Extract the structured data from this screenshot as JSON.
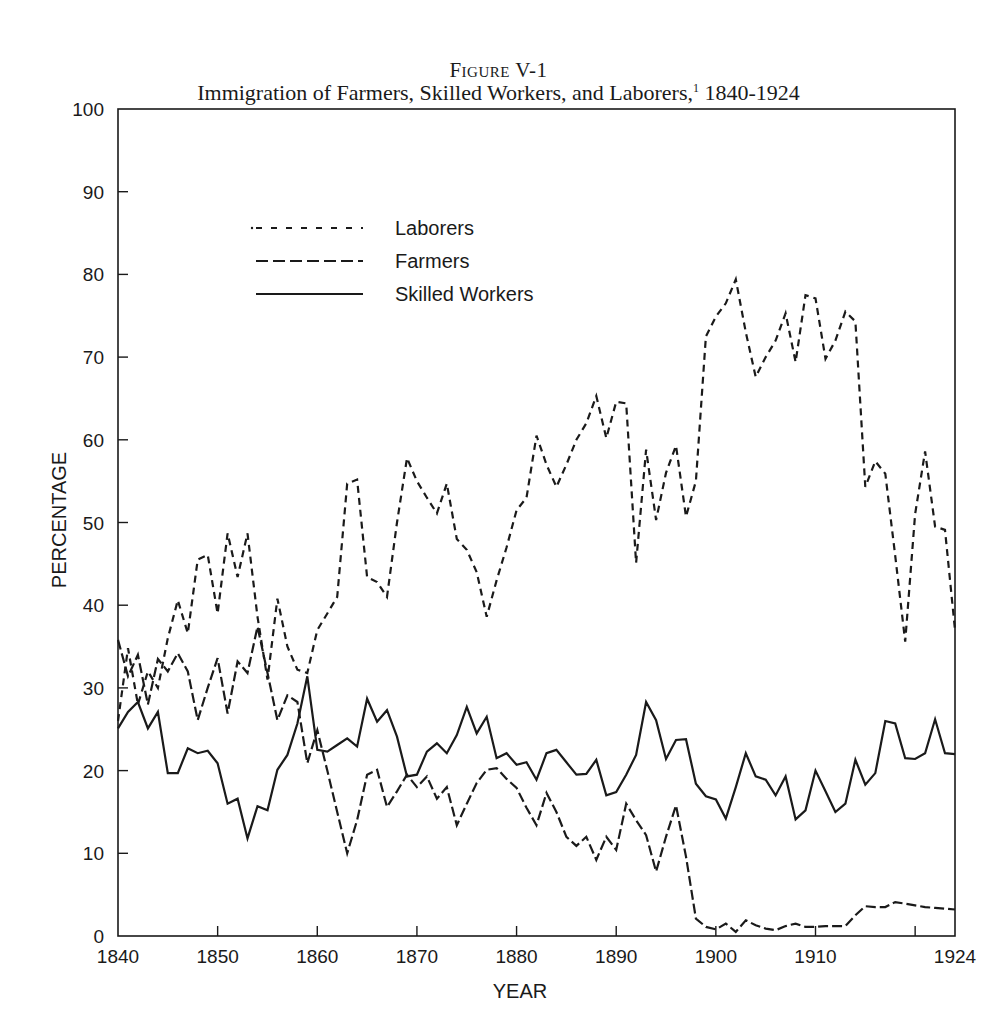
{
  "figure": {
    "number": "Figure V-1",
    "title": "Immigration of Farmers, Skilled Workers, and Laborers,",
    "footnote_mark": "1",
    "title_range": "1840-1924"
  },
  "chart_data": {
    "type": "line",
    "subtitle": "Figure V-1",
    "xlabel": "YEAR",
    "ylabel": "PERCENTAGE",
    "xlim": [
      1840,
      1924
    ],
    "ylim": [
      0,
      100
    ],
    "x_ticks": [
      1840,
      1850,
      1860,
      1870,
      1880,
      1890,
      1900,
      1910,
      1920,
      1924
    ],
    "x_tick_labels": [
      "1840",
      "1850",
      "1860",
      "1870",
      "1880",
      "1890",
      "1900",
      "1910",
      "",
      "1924"
    ],
    "y_ticks": [
      0,
      10,
      20,
      30,
      40,
      50,
      60,
      70,
      80,
      90,
      100
    ],
    "grid": false,
    "legend_position": "upper-left inside plot",
    "x": [
      1840,
      1841,
      1842,
      1843,
      1844,
      1845,
      1846,
      1847,
      1848,
      1849,
      1850,
      1851,
      1852,
      1853,
      1854,
      1855,
      1856,
      1857,
      1858,
      1859,
      1860,
      1861,
      1862,
      1863,
      1864,
      1865,
      1866,
      1867,
      1868,
      1869,
      1870,
      1871,
      1872,
      1873,
      1874,
      1875,
      1876,
      1877,
      1878,
      1879,
      1880,
      1881,
      1882,
      1883,
      1884,
      1885,
      1886,
      1887,
      1888,
      1889,
      1890,
      1891,
      1892,
      1893,
      1894,
      1895,
      1896,
      1897,
      1898,
      1899,
      1900,
      1901,
      1902,
      1903,
      1904,
      1905,
      1906,
      1907,
      1908,
      1909,
      1910,
      1911,
      1912,
      1913,
      1914,
      1915,
      1916,
      1917,
      1918,
      1919,
      1920,
      1921,
      1922,
      1923,
      1924
    ],
    "series": [
      {
        "name": "Laborers",
        "style": "short-dash",
        "values": [
          26,
          34.8,
          28,
          32,
          30,
          36,
          40.6,
          36.6,
          45.5,
          46.1,
          39,
          48.7,
          43.4,
          48.7,
          38.6,
          31,
          40.8,
          35,
          32.2,
          31.8,
          37,
          39,
          41,
          54.7,
          55.2,
          43.4,
          42.8,
          41,
          50,
          57.8,
          55,
          53,
          51.1,
          54.7,
          48,
          46.7,
          44,
          38.6,
          43,
          47,
          51.5,
          53,
          60.5,
          57,
          54.3,
          57,
          60,
          62,
          65.3,
          60.2,
          64.6,
          64.4,
          45.1,
          58.8,
          50.3,
          56,
          59.3,
          50.7,
          55,
          72.5,
          74.9,
          76.5,
          79.4,
          73,
          67.6,
          70,
          72,
          75.3,
          69.4,
          77.5,
          77.1,
          69.8,
          72,
          75.5,
          74.3,
          54.3,
          57.4,
          55.9,
          46,
          35.6,
          51,
          58.6,
          49.5,
          49.1,
          37
        ]
      },
      {
        "name": "Farmers",
        "style": "long-dash",
        "values": [
          35.8,
          31.4,
          34,
          28,
          33.5,
          32,
          34.2,
          32,
          26.1,
          30,
          33.6,
          26.9,
          33.2,
          31.8,
          37.4,
          31.8,
          26.1,
          29.1,
          28.3,
          20.9,
          24.9,
          20,
          15,
          10,
          14,
          19.5,
          20.1,
          15.6,
          17.5,
          19.5,
          18,
          19.3,
          16.6,
          18,
          13.4,
          16,
          18.5,
          20.1,
          20.3,
          19,
          17.9,
          15.5,
          13.4,
          17.3,
          15,
          12,
          10.9,
          12,
          9.2,
          12,
          10.4,
          16,
          14,
          12.2,
          7.8,
          12,
          15.8,
          9.6,
          2.1,
          1.1,
          0.8,
          1.5,
          0.5,
          1.9,
          1.3,
          0.9,
          0.7,
          1.2,
          1.5,
          1.1,
          1.1,
          1.2,
          1.2,
          1.2,
          2.5,
          3.6,
          3.5,
          3.5,
          4.1,
          3.9,
          3.7,
          3.5,
          3.4,
          3.3,
          3.2
        ]
      },
      {
        "name": "Skilled Workers",
        "style": "solid",
        "values": [
          25.1,
          27.1,
          28.3,
          25.1,
          27.1,
          19.7,
          19.7,
          22.7,
          22.1,
          22.4,
          20.9,
          16,
          16.6,
          11.8,
          15.7,
          15.2,
          20.1,
          21.9,
          25.7,
          31.4,
          22.5,
          22.3,
          23.1,
          23.9,
          22.9,
          28.7,
          25.9,
          27.3,
          24.1,
          19.3,
          19.5,
          22.3,
          23.3,
          22.1,
          24.3,
          27.7,
          24.5,
          26.5,
          21.5,
          22.1,
          20.7,
          21,
          18.9,
          22.1,
          22.5,
          21,
          19.5,
          19.6,
          21.3,
          17,
          17.4,
          19.5,
          21.9,
          28.3,
          26.1,
          21.4,
          23.7,
          23.8,
          18.4,
          16.9,
          16.5,
          14.2,
          18,
          22.1,
          19.3,
          18.9,
          17,
          19.3,
          14.1,
          15.2,
          20,
          17.5,
          15,
          16,
          21.3,
          18.3,
          19.7,
          26,
          25.7,
          21.5,
          21.4,
          22.1,
          26.2,
          22.1,
          22
        ]
      }
    ]
  },
  "legend": {
    "items": [
      {
        "label": "Laborers",
        "style": "short-dash"
      },
      {
        "label": "Farmers",
        "style": "long-dash"
      },
      {
        "label": "Skilled Workers",
        "style": "solid"
      }
    ]
  },
  "colors": {
    "ink": "#1a1a1a",
    "background": "#ffffff"
  }
}
